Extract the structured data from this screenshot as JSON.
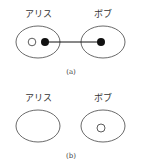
{
  "colors": {
    "stroke": "#333333",
    "fill_dot": "#111111",
    "background": "#ffffff"
  },
  "panels": [
    {
      "caption": "(a)",
      "parties": [
        {
          "label": "アリス",
          "particles": [
            {
              "type": "open"
            },
            {
              "type": "filled"
            }
          ]
        },
        {
          "label": "ボブ",
          "particles": [
            {
              "type": "filled"
            }
          ]
        }
      ],
      "link": "entangled-line between Alice's filled dot and Bob's filled dot"
    },
    {
      "caption": "(b)",
      "parties": [
        {
          "label": "アリス",
          "particles": []
        },
        {
          "label": "ボブ",
          "particles": [
            {
              "type": "open"
            }
          ]
        }
      ]
    }
  ]
}
